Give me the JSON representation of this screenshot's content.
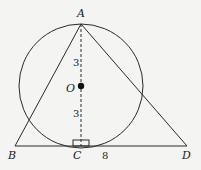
{
  "diagram": {
    "type": "geometry",
    "points": {
      "A": {
        "label": "A",
        "x": 81,
        "y": 24
      },
      "B": {
        "label": "B",
        "x": 15,
        "y": 146
      },
      "C": {
        "label": "C",
        "x": 81,
        "y": 146
      },
      "D": {
        "label": "D",
        "x": 187,
        "y": 146
      },
      "O": {
        "label": "O",
        "x": 81,
        "y": 86
      }
    },
    "circle": {
      "center": "O",
      "radius_px": 62
    },
    "segments": [
      {
        "from": "A",
        "to": "B",
        "style": "solid"
      },
      {
        "from": "A",
        "to": "D",
        "style": "solid"
      },
      {
        "from": "B",
        "to": "D",
        "style": "solid"
      },
      {
        "from": "A",
        "to": "C",
        "style": "dashed"
      }
    ],
    "measurements": {
      "AO": "3",
      "OC": "3",
      "CD": "8"
    },
    "right_angle_at": "C",
    "colors": {
      "stroke": "#2a2a2a",
      "background": "#f4f4f2"
    }
  }
}
